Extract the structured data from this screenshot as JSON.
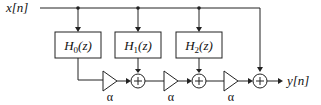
{
  "diagram": {
    "input_label": "x[n]",
    "output_label": "y[n]",
    "filters": [
      {
        "name": "H",
        "sub": "0",
        "arg": "(z)"
      },
      {
        "name": "H",
        "sub": "1",
        "arg": "(z)"
      },
      {
        "name": "H",
        "sub": "2",
        "arg": "(z)"
      }
    ],
    "gains": [
      "α",
      "α",
      "α"
    ],
    "adders": [
      "+",
      "+",
      "+"
    ],
    "colors": {
      "line": "#222222",
      "background": "#ffffff"
    }
  }
}
